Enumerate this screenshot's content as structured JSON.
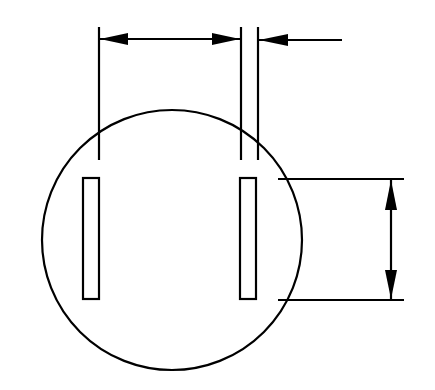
{
  "diagram": {
    "title": "",
    "colors": {
      "line": "#000000",
      "background": "#ffffff"
    },
    "elements": {
      "plug_face": {
        "shape": "circle",
        "cx": 172,
        "cy": 240,
        "r": 130
      },
      "left_slot": {
        "x": 83,
        "y": 178,
        "w": 16,
        "h": 121
      },
      "right_slot": {
        "x": 240,
        "y": 178,
        "w": 16,
        "h": 121
      },
      "slot_spacing_dimension": {
        "from_x": 99,
        "to_x": 241,
        "y": 39
      },
      "slot_width_dimension": {
        "from_x": 241,
        "to_x": 258,
        "y": 39
      },
      "slot_length_dimension": {
        "x": 391,
        "from_y": 178,
        "to_y": 300
      }
    },
    "labels": []
  }
}
